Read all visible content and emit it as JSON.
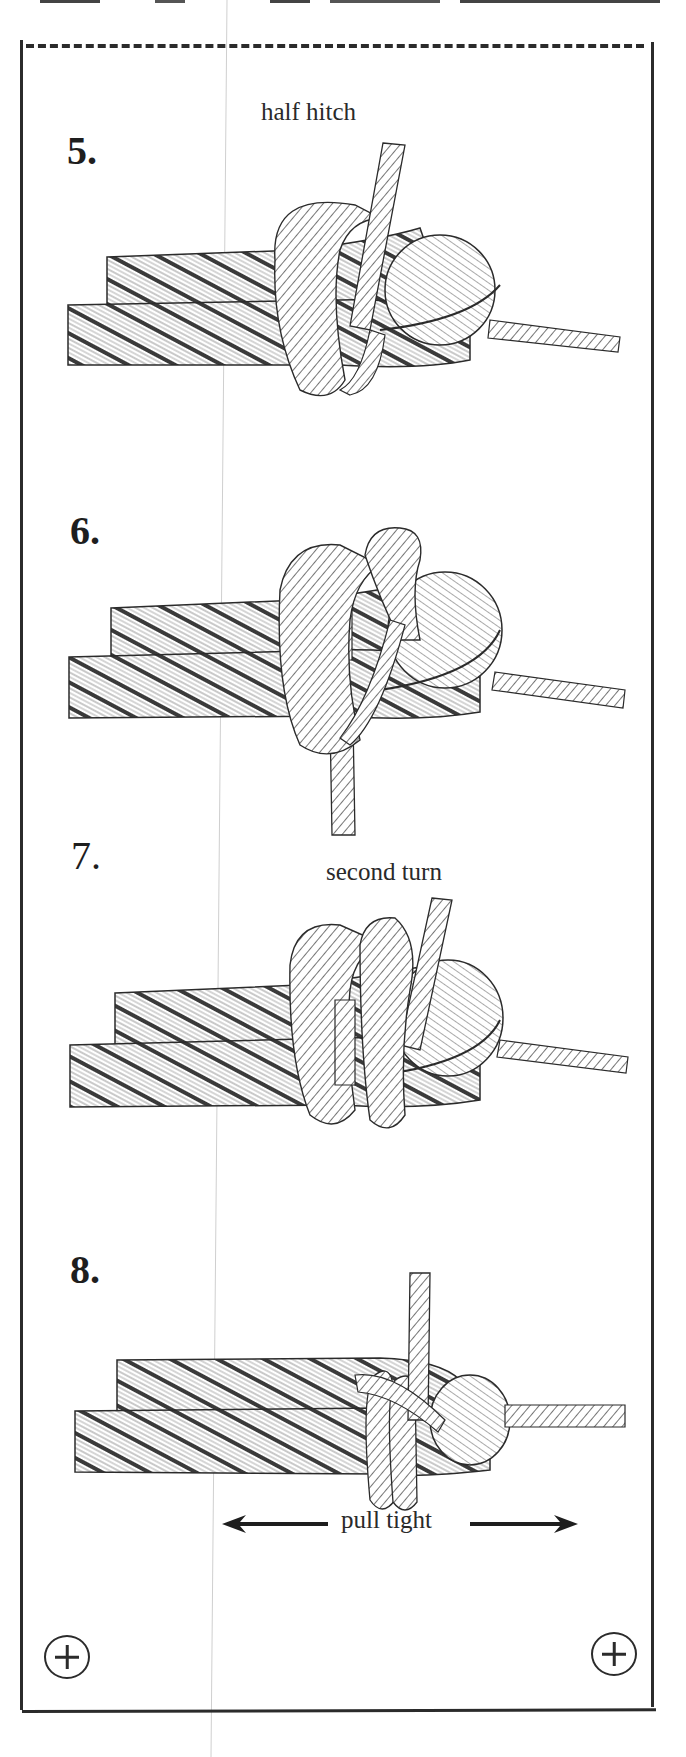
{
  "document": {
    "type": "knot-tying instructions (cut-out card)",
    "colors": {
      "ink": "#2b2b2b",
      "paper": "#ffffff"
    }
  },
  "steps": [
    {
      "number": "5.",
      "caption": "half hitch"
    },
    {
      "number": "6.",
      "caption": ""
    },
    {
      "number": "7.",
      "caption": "second turn"
    },
    {
      "number": "8.",
      "caption": "pull tight",
      "arrows": [
        "arrow-left",
        "arrow-right"
      ]
    }
  ],
  "marks": {
    "top_border": "dashed-cut-line",
    "bottom_left": "registration-plus-circle",
    "bottom_right": "registration-plus-circle"
  }
}
